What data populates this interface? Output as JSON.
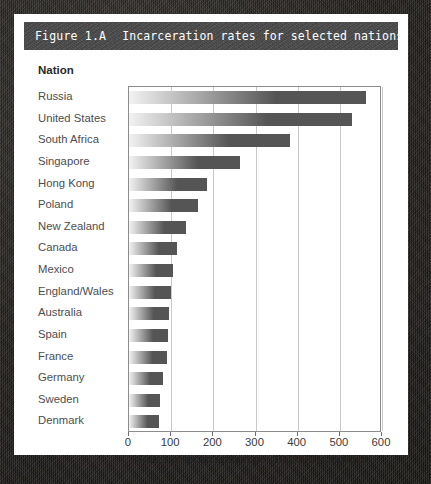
{
  "figure": {
    "label": "Figure 1.A",
    "caption": "Incarceration rates for selected nations."
  },
  "column_header": "Nation",
  "chart_data": {
    "type": "bar",
    "orientation": "horizontal",
    "title": "Incarceration rates for selected nations.",
    "xlabel": "Rates of incarceration per 100,000 population",
    "ylabel": "Nation",
    "xlim": [
      0,
      600
    ],
    "xticks": [
      0,
      100,
      200,
      300,
      400,
      500,
      600
    ],
    "grid": true,
    "legend": "none",
    "categories": [
      "Russia",
      "United States",
      "South Africa",
      "Singapore",
      "Hong Kong",
      "Poland",
      "New Zealand",
      "Canada",
      "Mexico",
      "England/Wales",
      "Australia",
      "Spain",
      "France",
      "Germany",
      "Sweden",
      "Denmark"
    ],
    "values": [
      563,
      528,
      382,
      264,
      186,
      163,
      135,
      115,
      105,
      100,
      96,
      93,
      91,
      80,
      73,
      70
    ]
  },
  "colors": {
    "banner_background": "#4a4a4a",
    "banner_text": "#ffffff",
    "page_background": "#ffffff",
    "border_background": "#232020",
    "bar_light": "#f2f2f2",
    "bar_dark": "#555555",
    "gridline": "#c9c9c9",
    "axis": "#8c8c8c",
    "label_text": "#4d4d4d"
  }
}
